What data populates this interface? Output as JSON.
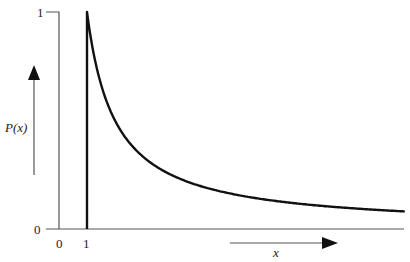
{
  "chart_data": {
    "type": "line",
    "title": "",
    "xlabel": "x",
    "ylabel": "P(x)",
    "x_ticks": [
      "0",
      "1"
    ],
    "y_ticks": [
      "0",
      "1"
    ],
    "xlim": [
      0,
      12.4
    ],
    "ylim": [
      0,
      1
    ],
    "grid": false,
    "legend": null,
    "annotations": [
      "vertical arrow next to P(x) pointing up",
      "horizontal arrow above x pointing right"
    ],
    "series": [
      {
        "name": "P(x)",
        "description": "Power-law decay P(x) ~ 1/x for x >= 1, zero below x = 1 (vertical drop at x = 1)",
        "x": [
          1,
          1.5,
          2,
          3,
          4,
          5,
          6,
          8,
          10,
          12.4
        ],
        "values": [
          1.0,
          0.67,
          0.5,
          0.33,
          0.25,
          0.2,
          0.17,
          0.12,
          0.09,
          0.06
        ]
      }
    ]
  },
  "labels": {
    "y_tick_top": "1",
    "y_tick_bottom": "0",
    "x_tick_0": "0",
    "x_tick_1": "1",
    "y_axis_label": "P(x)",
    "x_axis_label": "x"
  },
  "colors": {
    "curve": "#111111",
    "axis": "#555555"
  }
}
